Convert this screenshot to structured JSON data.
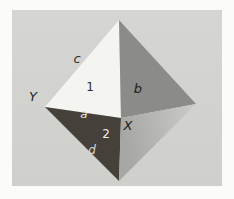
{
  "figure": {
    "page_background": "#fbfbf9",
    "photo": {
      "x": 12,
      "y": 10,
      "width": 210,
      "height": 176,
      "fill_top": "#d5d5d2",
      "fill_bottom": "#cfcfcb"
    },
    "octahedron": {
      "vertices": {
        "top": [
          119,
          20
        ],
        "left": [
          45,
          107
        ],
        "front": [
          121,
          118
        ],
        "right": [
          196,
          104
        ],
        "bottom": [
          119,
          181
        ]
      },
      "faces": [
        {
          "name": "upper-left-face",
          "corners": [
            "top",
            "left",
            "front"
          ],
          "fill": "#f4f4f0"
        },
        {
          "name": "upper-right-face",
          "corners": [
            "top",
            "front",
            "right"
          ],
          "fill": "#8b8b89"
        },
        {
          "name": "lower-left-face",
          "corners": [
            "left",
            "bottom",
            "front"
          ],
          "fill": "#46403a"
        },
        {
          "name": "lower-right-face",
          "corners": [
            "front",
            "bottom",
            "right"
          ],
          "fill": "gradient",
          "gradient": {
            "from": "#a7a7a4",
            "to": "#cbcbc8"
          }
        }
      ]
    },
    "labels": [
      {
        "name": "edge-label-c",
        "text": "c",
        "x": 77,
        "y": 63,
        "fill": "#2e2e2b",
        "italic": true,
        "size": 13
      },
      {
        "name": "vertex-label-Y",
        "text": "Y",
        "x": 33,
        "y": 101,
        "fill": "#211f1c",
        "italic": true,
        "size": 13
      },
      {
        "name": "face-label-1",
        "text": "1",
        "x": 90,
        "y": 91,
        "fill": "#2b2b27",
        "italic": false,
        "size": 12
      },
      {
        "name": "face-label-b",
        "text": "b",
        "x": 138,
        "y": 93,
        "fill": "#1d1d1a",
        "italic": true,
        "size": 13
      },
      {
        "name": "edge-label-a",
        "text": "a",
        "x": 84,
        "y": 118,
        "fill": "#e3e3dd",
        "italic": true,
        "size": 12
      },
      {
        "name": "vertex-label-X",
        "text": "X",
        "x": 128,
        "y": 130,
        "fill": "#191917",
        "italic": true,
        "size": 13
      },
      {
        "name": "face-label-2",
        "text": "2",
        "x": 106,
        "y": 138,
        "fill": "#eeeee8",
        "italic": false,
        "size": 12
      },
      {
        "name": "edge-label-d",
        "text": "d",
        "x": 92,
        "y": 154,
        "fill": "#d9d9d2",
        "italic": true,
        "size": 12
      }
    ]
  }
}
